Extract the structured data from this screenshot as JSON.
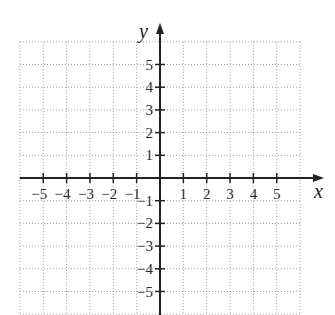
{
  "chart_data": {
    "type": "scatter",
    "title": "",
    "subtitle": "",
    "xlabel": "x",
    "ylabel": "y",
    "xlim": [
      -6,
      6
    ],
    "ylim": [
      -6,
      6
    ],
    "grid": true,
    "grid_style": "dotted",
    "x_ticks": [
      -5,
      -4,
      -3,
      -2,
      -1,
      1,
      2,
      3,
      4,
      5
    ],
    "y_ticks": [
      5,
      4,
      3,
      2,
      1,
      -1,
      -2,
      -3,
      -4,
      -5
    ],
    "x_tick_labels": [
      "−5",
      "−4",
      "−3",
      "−2",
      "−1",
      "1",
      "2",
      "3",
      "4",
      "5"
    ],
    "y_tick_labels": [
      "5",
      "4",
      "3",
      "2",
      "1",
      "−1",
      "−2",
      "−3",
      "−4",
      "−5"
    ],
    "series": [],
    "legend": null
  },
  "axes": {
    "x_label": "x",
    "y_label": "y"
  },
  "colors": {
    "axis": "#222222",
    "grid": "#9a9a9a",
    "text": "#2a2a2a",
    "background": "#ffffff"
  }
}
